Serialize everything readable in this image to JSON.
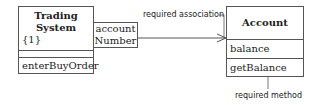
{
  "classes": {
    "trading_system": {
      "name_line1": "Trading",
      "name_line2": "System",
      "multiplicity": "{1}",
      "method": "enterBuyOrder"
    },
    "qualifier": {
      "line1": "account",
      "line2": "Number"
    },
    "account": {
      "name": "Account",
      "attribute": "balance",
      "method": "getBalance"
    }
  },
  "annotations": {
    "association": "required association",
    "method": "required method"
  }
}
